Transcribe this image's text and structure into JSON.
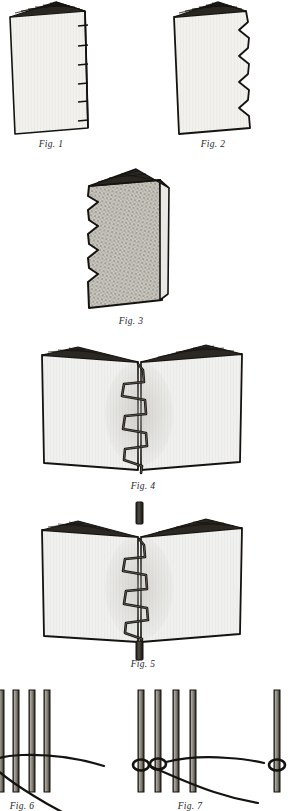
{
  "document": {
    "kind": "bookbinding-instruction-plate",
    "subject": "Sawing-in and sewing a book on cords",
    "background_color": "#ffffff",
    "ink_color": "#15130f",
    "paper_color": "#f2f2ef"
  },
  "figures": [
    {
      "id": "fig-1",
      "caption": "Fig. 1",
      "description": "Closed book block standing on edge, spine at right marked with shallow saw-kerf notches",
      "notch_count": 6,
      "notch_style": "slit"
    },
    {
      "id": "fig-2",
      "caption": "Fig. 2",
      "description": "Same book block with deep V-shaped saw cuts along the spine edge",
      "notch_count": 5,
      "notch_style": "sawtooth"
    },
    {
      "id": "fig-3",
      "caption": "Fig. 3",
      "description": "Book block viewed from the spine side, shaded cloth texture, sawtooth kerfs at left",
      "notch_count": 5,
      "notch_style": "sawtooth"
    },
    {
      "id": "fig-4",
      "caption": "Fig. 4",
      "description": "Opened section showing zig-zag sewing thread running down the centre fold",
      "zigzag_peaks": 4
    },
    {
      "id": "fig-5",
      "caption": "Fig. 5",
      "description": "Opened section with zig-zag sewing plus a vertical cord projecting above and below the spine",
      "zigzag_peaks": 4,
      "cord_count": 1
    },
    {
      "id": "fig-6",
      "caption": "Fig. 6",
      "description": "Four vertical cords with the sewing thread carried straight across them",
      "cord_count": 4,
      "loop_count": 0
    },
    {
      "id": "fig-7",
      "caption": "Fig. 7",
      "description": "Four vertical cords with the thread looped around the first two cords",
      "cord_count": 4,
      "loop_count": 2
    },
    {
      "id": "fig-8",
      "caption": "",
      "description": "Partial figure cropped at the right edge: single cord with a thread loop",
      "cord_count": 1,
      "loop_count": 1
    }
  ],
  "captions": {
    "fig1": "Fig. 1",
    "fig2": "Fig. 2",
    "fig3": "Fig. 3",
    "fig4": "Fig. 4",
    "fig5": "Fig. 5",
    "fig6": "Fig. 6",
    "fig7": "Fig. 7"
  }
}
